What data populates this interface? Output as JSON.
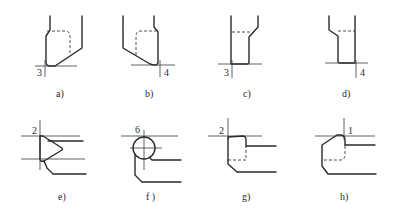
{
  "figure": {
    "panels": [
      {
        "id": "a",
        "caption": "a)",
        "point_number": "3"
      },
      {
        "id": "b",
        "caption": "b)",
        "point_number": "4"
      },
      {
        "id": "c",
        "caption": "c)",
        "point_number": "3"
      },
      {
        "id": "d",
        "caption": "d)",
        "point_number": "4"
      },
      {
        "id": "e",
        "caption": "e)",
        "point_number": "2"
      },
      {
        "id": "f",
        "caption": "f )",
        "point_number": "6"
      },
      {
        "id": "g",
        "caption": "g)",
        "point_number": "2"
      },
      {
        "id": "h",
        "caption": "h)",
        "point_number": "1"
      }
    ],
    "colors": {
      "line": "#2a2a2a",
      "background": "#ffffff"
    }
  }
}
